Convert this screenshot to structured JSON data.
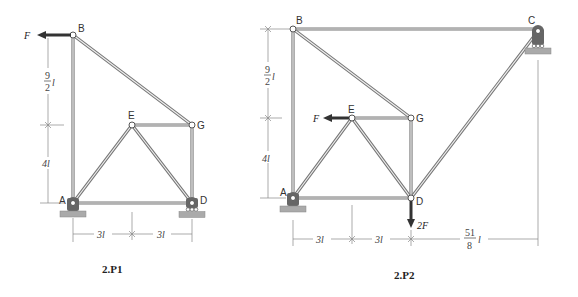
{
  "figures": [
    {
      "id": "2.P1",
      "caption": "2.P1",
      "nodes": {
        "A": "A",
        "B": "B",
        "D": "D",
        "E": "E",
        "G": "G"
      },
      "load": {
        "label": "F",
        "at": "B",
        "direction": "left"
      },
      "dimensions": {
        "upper": "9/2 l",
        "upper_num": "9",
        "upper_den": "2",
        "lower": "4l",
        "left_span": "3l",
        "right_span": "3l"
      },
      "supports": {
        "A": "pin",
        "D": "roller"
      }
    },
    {
      "id": "2.P2",
      "caption": "2.P2",
      "nodes": {
        "A": "A",
        "B": "B",
        "C": "C",
        "D": "D",
        "E": "E",
        "G": "G"
      },
      "loads": [
        {
          "label": "F",
          "at": "E",
          "direction": "left"
        },
        {
          "label": "2F",
          "at": "D",
          "direction": "down"
        }
      ],
      "dimensions": {
        "upper": "9/2 l",
        "upper_num": "9",
        "upper_den": "2",
        "lower": "4l",
        "span1": "3l",
        "span2": "3l",
        "span3": "51/8 l",
        "span3_num": "51",
        "span3_den": "8"
      },
      "supports": {
        "A": "pin",
        "C": "roller"
      }
    }
  ],
  "symbols": {
    "length": "l"
  }
}
